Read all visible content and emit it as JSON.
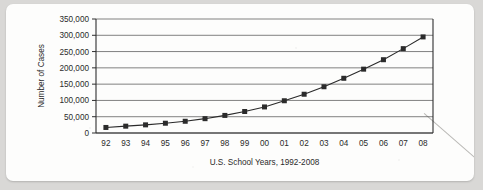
{
  "chart_data": {
    "type": "line",
    "title": "",
    "xlabel": "U.S. School Years, 1992-2008",
    "ylabel": "Number of Cases",
    "categories": [
      "92",
      "93",
      "94",
      "95",
      "96",
      "97",
      "98",
      "99",
      "00",
      "01",
      "02",
      "03",
      "04",
      "05",
      "06",
      "07",
      "08"
    ],
    "values": [
      17000,
      21000,
      25000,
      30000,
      36000,
      44000,
      54000,
      66000,
      80000,
      99000,
      119000,
      142000,
      168000,
      196000,
      225000,
      259000,
      295000
    ],
    "series": [
      {
        "name": "Number of Cases",
        "values": [
          17000,
          21000,
          25000,
          30000,
          36000,
          44000,
          54000,
          66000,
          80000,
          99000,
          119000,
          142000,
          168000,
          196000,
          225000,
          259000,
          295000
        ]
      }
    ],
    "ylim": [
      0,
      350000
    ],
    "ytick_values": [
      0,
      50000,
      100000,
      150000,
      200000,
      250000,
      300000,
      350000
    ],
    "ytick_labels": [
      "0",
      "50,000",
      "100,000",
      "150,000",
      "200,000",
      "250,000",
      "300,000",
      "350,000"
    ],
    "xtick_labels": [
      "92",
      "93",
      "94",
      "95",
      "96",
      "97",
      "98",
      "99",
      "00",
      "01",
      "02",
      "03",
      "04",
      "05",
      "06",
      "07",
      "08"
    ],
    "grid": true,
    "grid_axis": "y",
    "legend": false,
    "legend_position": "none",
    "marker": "square",
    "line_color": "#2a2a2a",
    "marker_color": "#2b2b2b",
    "background_color": "#fdfdfc",
    "page_background_color": "#d9d8d6"
  }
}
